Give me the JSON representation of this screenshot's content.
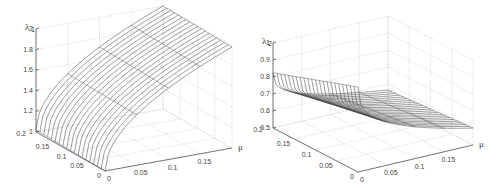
{
  "chart_data": [
    {
      "type": "surface",
      "title": "",
      "zlabel": "λ1",
      "xlabel": "μ",
      "ylabel": "",
      "x_ticks": [
        "0",
        "0.05",
        "0.1",
        "0.15"
      ],
      "y_ticks": [
        "0",
        "0.05",
        "0.1",
        "0.15",
        "0.2"
      ],
      "z_ticks": [
        "1",
        "1.2",
        "1.4",
        "1.6",
        "1.8",
        "2"
      ],
      "xlim": [
        0,
        0.2
      ],
      "ylim": [
        0,
        0.2
      ],
      "zlim": [
        1,
        2
      ],
      "grid": true,
      "description": "Mesh surface increasing from ~1 at μ=0 to ~2 at μ=0.2; concave rise, nearly independent of second variable"
    },
    {
      "type": "surface",
      "title": "",
      "zlabel": "λ2",
      "xlabel": "μ",
      "ylabel": "",
      "x_ticks": [
        "0",
        "0.05",
        "0.1",
        "0.15"
      ],
      "y_ticks": [
        "0",
        "0.05",
        "0.1",
        "0.15",
        "0.2"
      ],
      "z_ticks": [
        "0.5",
        "0.6",
        "0.7",
        "0.8",
        "0.9",
        "1"
      ],
      "xlim": [
        0,
        0.2
      ],
      "ylim": [
        0,
        0.2
      ],
      "zlim": [
        0.5,
        1
      ],
      "grid": true,
      "description": "Mesh surface decreasing from ~1 at μ=0 to ~0.5 at μ=0.2; steep drop near μ=0 then leveling"
    }
  ],
  "left": {
    "zlabel": "λ",
    "zsub": "1",
    "xlabel": "μ",
    "z_ticks": [
      "1",
      "1.2",
      "1.4",
      "1.6",
      "1.8",
      "2"
    ],
    "y_ticks": [
      "0.2",
      "0.15",
      "0.1",
      "0.05",
      "0"
    ],
    "x_ticks": [
      "0",
      "0.05",
      "0.1",
      "0.15"
    ]
  },
  "right": {
    "zlabel": "λ",
    "zsub": "2",
    "xlabel": "μ",
    "z_ticks": [
      "0.5",
      "0.6",
      "0.7",
      "0.8",
      "0.9",
      "1"
    ],
    "y_ticks": [
      "0.2",
      "0.15",
      "0.1",
      "0.05",
      "0"
    ],
    "x_ticks": [
      "0",
      "0.05",
      "0.1",
      "0.15"
    ]
  }
}
